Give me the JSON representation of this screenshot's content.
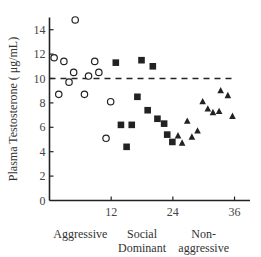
{
  "chart_data": {
    "type": "scatter",
    "title": "",
    "xlabel": "",
    "ylabel": "Plasma Testosterone ( μg/mL)",
    "xlim": [
      0,
      38
    ],
    "ylim": [
      0,
      15
    ],
    "x_ticks": [
      12,
      24,
      36
    ],
    "y_ticks": [
      0,
      2,
      4,
      6,
      8,
      10,
      12,
      14
    ],
    "grid": false,
    "legend": null,
    "reference_line": {
      "y": 10,
      "style": "dashed"
    },
    "category_labels": [
      {
        "lines": [
          "Aggressive"
        ],
        "x": 6
      },
      {
        "lines": [
          "Social",
          "Dominant"
        ],
        "x": 18
      },
      {
        "lines": [
          "Non-",
          "aggressive"
        ],
        "x": 30
      }
    ],
    "series": [
      {
        "name": "Aggressive",
        "marker": "open-circle",
        "points": [
          [
            5.0,
            14.8
          ],
          [
            0.9,
            11.7
          ],
          [
            2.8,
            11.4
          ],
          [
            8.8,
            11.4
          ],
          [
            4.7,
            10.5
          ],
          [
            7.6,
            10.2
          ],
          [
            9.6,
            10.5
          ],
          [
            3.8,
            9.7
          ],
          [
            1.8,
            8.7
          ],
          [
            6.8,
            8.7
          ],
          [
            11.9,
            8.1
          ],
          [
            11.0,
            5.1
          ]
        ]
      },
      {
        "name": "Social Dominant",
        "marker": "filled-square",
        "points": [
          [
            12.9,
            11.3
          ],
          [
            17.9,
            11.5
          ],
          [
            20.1,
            11.0
          ],
          [
            17.1,
            8.5
          ],
          [
            19.1,
            7.4
          ],
          [
            21.0,
            6.7
          ],
          [
            22.3,
            6.3
          ],
          [
            13.9,
            6.2
          ],
          [
            16.0,
            6.2
          ],
          [
            22.9,
            5.4
          ],
          [
            23.9,
            4.8
          ],
          [
            15.0,
            4.4
          ]
        ]
      },
      {
        "name": "Non-aggressive",
        "marker": "filled-triangle",
        "points": [
          [
            25.0,
            5.3
          ],
          [
            25.8,
            4.7
          ],
          [
            26.8,
            6.5
          ],
          [
            27.7,
            5.2
          ],
          [
            28.8,
            5.7
          ],
          [
            29.8,
            8.1
          ],
          [
            30.8,
            7.5
          ],
          [
            31.8,
            7.2
          ],
          [
            33.0,
            7.3
          ],
          [
            33.3,
            9.0
          ],
          [
            34.7,
            8.6
          ],
          [
            35.6,
            6.9
          ]
        ]
      }
    ]
  },
  "colors": {
    "axis": "#222222",
    "marker": "#222222",
    "text": "#333333"
  }
}
